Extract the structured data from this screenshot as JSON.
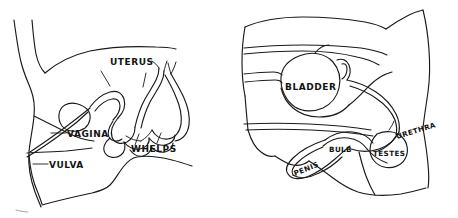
{
  "figure": {
    "background_color": "#ffffff",
    "ink_color": "#1a1a1a",
    "panels": [
      {
        "id": "female",
        "name": "female-reproductive-diagram",
        "labels": [
          {
            "id": "uterus",
            "text": "UTERUS"
          },
          {
            "id": "vagina",
            "text": "VAGINA"
          },
          {
            "id": "vulva",
            "text": "VULVA"
          },
          {
            "id": "whelps",
            "text": "WHELPS"
          }
        ]
      },
      {
        "id": "male",
        "name": "male-reproductive-diagram",
        "labels": [
          {
            "id": "bladder",
            "text": "BLADDER"
          },
          {
            "id": "urethra",
            "text": "URETHRA"
          },
          {
            "id": "bulb",
            "text": "BULB"
          },
          {
            "id": "testes",
            "text": "TESTES"
          },
          {
            "id": "penis",
            "text": "PENIS"
          }
        ]
      }
    ]
  }
}
